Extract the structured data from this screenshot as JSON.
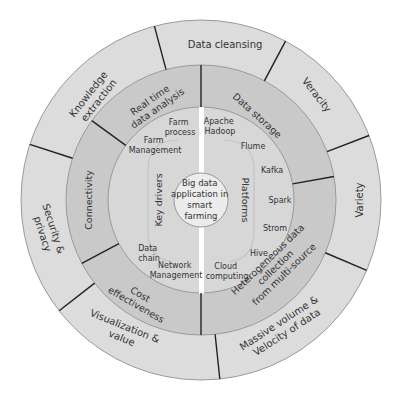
{
  "center": {
    "lines": [
      "Big data",
      "application in",
      "smart",
      "farming"
    ]
  },
  "inner_halves": {
    "left_title": "Key drivers",
    "right_title": "Platforms",
    "left_items": [
      {
        "lines": [
          "Farm",
          "process"
        ]
      },
      {
        "lines": [
          "Farm",
          "Management"
        ]
      },
      {
        "lines": [
          "Data",
          "chain"
        ]
      },
      {
        "lines": [
          "Network",
          "Management"
        ]
      }
    ],
    "right_items": [
      {
        "lines": [
          "Apache",
          "Hadoop"
        ]
      },
      {
        "lines": [
          "Flume"
        ]
      },
      {
        "lines": [
          "Kafka"
        ]
      },
      {
        "lines": [
          "Spark"
        ]
      },
      {
        "lines": [
          "Strom"
        ]
      },
      {
        "lines": [
          "Hive"
        ]
      },
      {
        "lines": [
          "Cloud",
          "computing"
        ]
      }
    ]
  },
  "middle_ring": [
    {
      "label": "Data storage"
    },
    {
      "label": "Heterogeneous data collection from multi-source",
      "lines": [
        "Heterogeneous data",
        "collection",
        "from multi-source"
      ]
    },
    {
      "label": "Cost effectiveness",
      "lines": [
        "Cost",
        "effectiveness"
      ]
    },
    {
      "label": "Connectivity"
    },
    {
      "label": "Real time data analysis",
      "lines": [
        "Real time",
        "data analysis"
      ]
    }
  ],
  "outer_ring": [
    {
      "label": "Data cleansing"
    },
    {
      "label": "Veracity"
    },
    {
      "label": "Variety"
    },
    {
      "label": "Massive volume & Velocity of data",
      "lines": [
        "Massive volume &",
        "Velocity of data"
      ]
    },
    {
      "label": "Visualization & value",
      "lines": [
        "Visualization &",
        "value"
      ]
    },
    {
      "label": "Security & privacy",
      "lines": [
        "Security &",
        "privacy"
      ]
    },
    {
      "label": "Knowledge extraction",
      "lines": [
        "Knowledge",
        "extraction"
      ]
    }
  ],
  "colors": {
    "outer_ring": "#dcdcdc",
    "middle_ring": "#c9c9c9",
    "inner_disc": "#d7d7d7",
    "center_circle": "#ececec",
    "divider": "#222222",
    "text": "#333333"
  }
}
